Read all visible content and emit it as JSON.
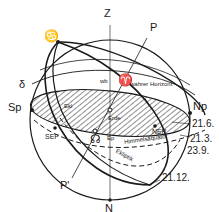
{
  "diagram": {
    "type": "celestial-sphere",
    "colors": {
      "line": "#1a1a1a",
      "background": "#ffffff",
      "hatch": "#333333"
    },
    "labels": {
      "zenith": "Z",
      "nadir": "N",
      "celestial_pole": "P",
      "celestial_pole_south": "P'",
      "south_point": "Sp",
      "north_point": "Np",
      "cancer": "♋",
      "descending_node_symbol": "☊",
      "vernal_point": "♈",
      "delta": "δ",
      "wb": "wb",
      "true_horizon": "wahrer Horizont",
      "earth": "Erde",
      "crossing": "Ekl",
      "ecliptic": "Ekliptik",
      "celestial_equator": "Himmelsäquator",
      "north_ecliptic_pole": "NEP",
      "south_ecliptic_pole": "SEP",
      "ep": "Ep",
      "date_summer_solstice": "21.6.",
      "date_equinox_spring": "21.3.",
      "date_equinox_autumn": "23.9.",
      "date_winter_solstice": "21.12."
    }
  }
}
